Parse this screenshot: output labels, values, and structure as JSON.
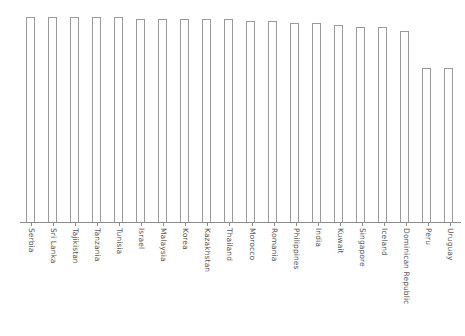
{
  "chart_data": {
    "type": "bar",
    "title": "",
    "subtitle": "",
    "xlabel": "",
    "ylabel": "",
    "grid": false,
    "legend": false,
    "legend_position": "none",
    "axis": {
      "x_visible": true,
      "y_visible": false,
      "x_tick_labels_rotation": 90,
      "ylim": [
        0,
        100
      ]
    },
    "categories": [
      "Serbia",
      "Sri Lanka",
      "Tajikistan",
      "Tanzania",
      "Tunisia",
      "Israel",
      "Malaysia",
      "Korea",
      "Kazakhstan",
      "Thailand",
      "Morocco",
      "Romania",
      "Philippines",
      "India",
      "Kuwait",
      "Singapore",
      "Iceland",
      "Dominican Republic",
      "Peru",
      "Uruguay"
    ],
    "values": [
      100,
      100,
      100,
      100,
      100,
      99,
      99,
      99,
      99,
      99,
      98,
      98,
      97,
      97,
      96,
      95,
      95,
      93,
      75,
      75
    ],
    "series": [
      {
        "name": "value",
        "values": [
          100,
          100,
          100,
          100,
          100,
          99,
          99,
          99,
          99,
          99,
          98,
          98,
          97,
          97,
          96,
          95,
          95,
          93,
          75,
          75
        ]
      }
    ],
    "style": {
      "bar_fill": "#ffffff",
      "bar_outline": "#9a9a9a",
      "axis_color": "#8d8d8d",
      "label_color": "#545454",
      "background": "#ffffff"
    }
  }
}
